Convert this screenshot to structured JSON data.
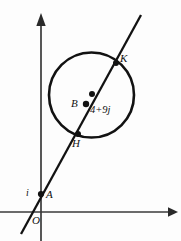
{
  "figure": {
    "width": 181,
    "height": 241,
    "background_color": "#fdfdfd",
    "stroke_color": "#121212",
    "axis_color": "#3a3a3a"
  },
  "axes": {
    "vertical": {
      "name": "imaginary-axis",
      "x": 41,
      "y_top": 16,
      "y_bottom": 241,
      "arrow": "up"
    },
    "horizontal": {
      "name": "real-axis",
      "y": 212,
      "x_left": 0,
      "x_right": 172,
      "arrow": "right"
    },
    "origin_label": "O"
  },
  "circle": {
    "center_x": 91.5,
    "center_y": 95,
    "radius": 42.5,
    "stroke_width": 2.6,
    "center_label": "B",
    "center_value": "4+9j"
  },
  "line": {
    "x1": 21,
    "y1": 234,
    "x2": 141,
    "y2": 15,
    "stroke_width": 2.3
  },
  "points": [
    {
      "id": "A",
      "label": "A",
      "x": 41,
      "y": 194,
      "note": "on imaginary axis"
    },
    {
      "id": "B",
      "label": "B",
      "x": 86,
      "y": 104,
      "note": "circle centre"
    },
    {
      "id": "M",
      "label": "",
      "x": 92,
      "y": 94,
      "note": "unlabelled dot on line"
    },
    {
      "id": "H",
      "label": "H",
      "x": 78,
      "y": 134,
      "note": "lower intersection"
    },
    {
      "id": "K",
      "label": "K",
      "x": 116,
      "y": 63,
      "note": "upper intersection"
    }
  ],
  "labels": {
    "unit_imaginary": "i",
    "point_a": "A",
    "point_b": "B",
    "point_h": "H",
    "point_k": "K",
    "origin": "O",
    "centre_value": "4+9j"
  }
}
